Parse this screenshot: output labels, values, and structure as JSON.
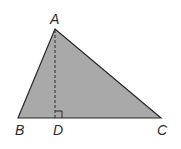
{
  "diagram": {
    "type": "triangle-with-altitude",
    "fill_color": "#a9a9a9",
    "stroke_color": "#2a2a2a",
    "vertices": {
      "A": {
        "label": "A",
        "x": 55,
        "y": 29
      },
      "B": {
        "label": "B",
        "x": 18,
        "y": 118
      },
      "C": {
        "label": "C",
        "x": 161,
        "y": 118
      },
      "D": {
        "label": "D",
        "x": 55,
        "y": 118
      }
    },
    "altitude": {
      "from": "A",
      "to": "D",
      "style": "dashed"
    },
    "right_angle_marker": {
      "at": "D"
    }
  }
}
